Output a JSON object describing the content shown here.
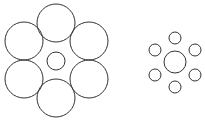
{
  "figure": {
    "stroke_color": "#333333",
    "background": "#ffffff",
    "left_group": {
      "center": {
        "cx": 56,
        "cy": 61,
        "r": 9
      },
      "surround_r": 19,
      "surround": [
        {
          "cx": 56,
          "cy": 23
        },
        {
          "cx": 24,
          "cy": 41
        },
        {
          "cx": 89,
          "cy": 41
        },
        {
          "cx": 24,
          "cy": 79
        },
        {
          "cx": 89,
          "cy": 79
        },
        {
          "cx": 56,
          "cy": 98
        }
      ]
    },
    "right_group": {
      "center": {
        "cx": 175,
        "cy": 62,
        "r": 11
      },
      "surround_r": 6,
      "surround": [
        {
          "cx": 175,
          "cy": 38
        },
        {
          "cx": 155,
          "cy": 50
        },
        {
          "cx": 195,
          "cy": 50
        },
        {
          "cx": 155,
          "cy": 75
        },
        {
          "cx": 195,
          "cy": 75
        },
        {
          "cx": 175,
          "cy": 87
        }
      ]
    }
  }
}
